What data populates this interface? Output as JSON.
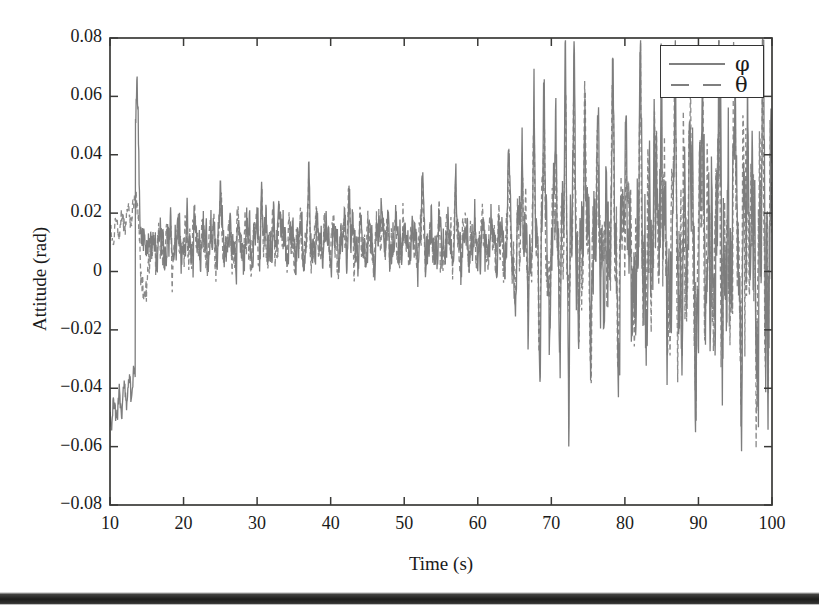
{
  "figure": {
    "background_color": "#ffffff",
    "frame_color": "#333333",
    "series_color": "#7f7f7f"
  },
  "chart_data": {
    "type": "line",
    "title": "",
    "xlabel": "Time (s)",
    "ylabel": "Attitude (rad)",
    "xlim": [
      10,
      100
    ],
    "ylim": [
      -0.08,
      0.08
    ],
    "xticks": [
      10,
      20,
      30,
      40,
      50,
      60,
      70,
      80,
      90,
      100
    ],
    "xtick_labels": [
      "10",
      "20",
      "30",
      "40",
      "50",
      "60",
      "70",
      "80",
      "90",
      "100"
    ],
    "yticks": [
      -0.08,
      -0.06,
      -0.04,
      -0.02,
      0,
      0.02,
      0.04,
      0.06,
      0.08
    ],
    "ytick_labels": [
      "−0.08",
      "−0.06",
      "−0.04",
      "−0.02",
      "0",
      "0.02",
      "0.04",
      "0.06",
      "0.08"
    ],
    "grid": false,
    "legend_position": "upper right",
    "legend": [
      {
        "label": "φ",
        "style": "solid",
        "color": "#7f7f7f"
      },
      {
        "label": "θ",
        "style": "dashed",
        "color": "#7f7f7f"
      }
    ],
    "series": [
      {
        "name": "φ",
        "style": "solid",
        "color": "#7f7f7f",
        "description": "Roll attitude. Begins near -0.050 rad at t=10 s, rises in steps to about -0.038 rad by t=13, then jumps abruptly to a peak of +0.053 rad at t=13.6. Settles into band noise about a mean of +0.010 rad with amplitude roughly 0.012 rad from t=16 to t=62. After t=62 the oscillation amplitude grows steadily, with a dominant transient near t=72 reaching +0.078 rad and -0.060 rad; large oscillations of 0.04 to 0.065 rad persist through t=100.",
        "mean_steady": 0.01,
        "peak_initial": 0.053,
        "peak_max": 0.078,
        "peak_min": -0.06
      },
      {
        "name": "θ",
        "style": "dashed",
        "color": "#7f7f7f",
        "description": "Pitch attitude. Begins near +0.012 rad at t=10, drifts up to about +0.022 rad by t=13, dips toward 0 near t=14.5 and -0.013 near t=16, then tracks the same noise band about a mean of +0.010 rad. Amplitude likewise grows after t=62 with excursions between -0.045 and +0.065 rad.",
        "mean_steady": 0.01,
        "peak_max": 0.065,
        "peak_min": -0.045
      }
    ],
    "regimes": [
      {
        "t_start": 10,
        "t_end": 16,
        "label": "initial transient"
      },
      {
        "t_start": 16,
        "t_end": 62,
        "label": "low-amplitude steady band"
      },
      {
        "t_start": 62,
        "t_end": 100,
        "label": "high-amplitude oscillation"
      }
    ]
  }
}
